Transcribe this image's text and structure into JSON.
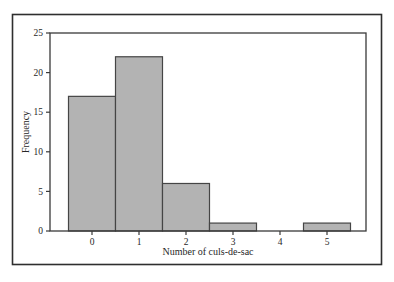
{
  "figure": {
    "width_px": 394,
    "height_px": 282
  },
  "chart_data": {
    "type": "bar",
    "kind": "histogram",
    "title": "",
    "xlabel": "Number of culs-de-sac",
    "ylabel": "Frequency",
    "categories": [
      "0",
      "1",
      "2",
      "3",
      "4",
      "5"
    ],
    "values": [
      17,
      22,
      6,
      1,
      0,
      1
    ],
    "ylim": [
      0,
      25
    ],
    "yticks": [
      0,
      5,
      10,
      15,
      20,
      25
    ],
    "grid": false,
    "legend": "none",
    "bar_gap": 0,
    "colors": {
      "bar_fill": "#b3b3b3",
      "bar_stroke": "#454545",
      "axis_stroke": "#3a3a3a",
      "frame_stroke": "#2e2e2e",
      "text": "#272727",
      "background": "#ffffff"
    }
  }
}
